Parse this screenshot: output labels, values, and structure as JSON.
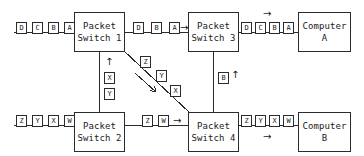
{
  "diagram": {
    "colors": {
      "line": "#2b2b2b",
      "background": "#ffffff",
      "text": "#1a1a1a"
    },
    "nodes": [
      {
        "id": "switch1",
        "line1": "Packet",
        "line2": "Switch 1"
      },
      {
        "id": "switch3",
        "line1": "Packet",
        "line2": "Switch 3"
      },
      {
        "id": "computerA",
        "line1": "Computer",
        "line2": "A"
      },
      {
        "id": "switch2",
        "line1": "Packet",
        "line2": "Switch 2"
      },
      {
        "id": "switch4",
        "line1": "Packet",
        "line2": "Switch 4"
      },
      {
        "id": "computerB",
        "line1": "Computer",
        "line2": "B"
      }
    ],
    "packet_groups": [
      {
        "id": "in-switch1",
        "labels": [
          "D",
          "C",
          "B",
          "A"
        ]
      },
      {
        "id": "switch1-to-switch3",
        "labels": [
          "D",
          "B",
          "A"
        ]
      },
      {
        "id": "switch3-to-compA",
        "labels": [
          "D",
          "C",
          "B",
          "A"
        ]
      },
      {
        "id": "switch1-to-switch2",
        "labels": [
          "X",
          "Y"
        ]
      },
      {
        "id": "switch1-to-switch4",
        "labels": [
          "Z",
          "Y",
          "X"
        ]
      },
      {
        "id": "switch3-to-switch4",
        "labels": [
          "B"
        ]
      },
      {
        "id": "in-switch2",
        "labels": [
          "Z",
          "Y",
          "X",
          "W"
        ]
      },
      {
        "id": "switch2-to-switch4",
        "labels": [
          "Z",
          "W"
        ]
      },
      {
        "id": "switch4-to-compB",
        "labels": [
          "Z",
          "Y",
          "X",
          "W"
        ]
      }
    ],
    "arrows": [
      {
        "id": "arrow-switch1-to-switch3",
        "glyph": "→"
      },
      {
        "id": "arrow-switch3-to-compA",
        "glyph": "→"
      },
      {
        "id": "arrow-switch2-up",
        "glyph": "↑"
      },
      {
        "id": "arrow-switch3-up",
        "glyph": "↑"
      },
      {
        "id": "arrow-switch2-to-switch4",
        "glyph": "→"
      },
      {
        "id": "arrow-switch4-to-compB",
        "glyph": "→"
      }
    ]
  }
}
